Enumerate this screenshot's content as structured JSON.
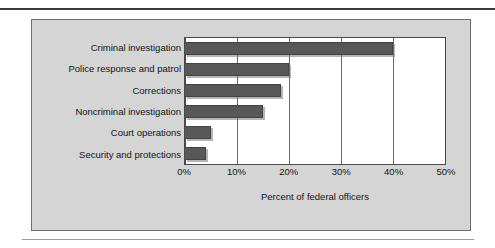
{
  "figure": {
    "panel_background": "#d5d5d5",
    "plot_background": "#ffffff",
    "bar_color": "#585858",
    "axis_color": "#4a4a4a"
  },
  "chart_data": {
    "type": "bar",
    "orientation": "horizontal",
    "title": "",
    "xlabel": "Percent of federal officers",
    "ylabel": "",
    "categories": [
      "Criminal investigation",
      "Police response and patrol",
      "Corrections",
      "Noncriminal investigation",
      "Court operations",
      "Security and protections"
    ],
    "values": [
      40,
      20,
      18.5,
      15,
      5,
      4
    ],
    "xlim": [
      0,
      50
    ],
    "xticks": [
      0,
      10,
      20,
      30,
      40,
      50
    ],
    "xtick_labels": [
      "0%",
      "10%",
      "20%",
      "30%",
      "40%",
      "50%"
    ],
    "grid": "vertical",
    "legend": "none"
  }
}
